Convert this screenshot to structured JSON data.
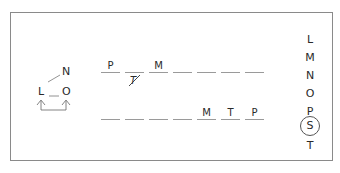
{
  "diagram": {
    "left_figure": {
      "nodes": [
        "N",
        "L",
        "O"
      ],
      "connector": "arrows from L and O joined by a bracket below"
    },
    "top_row": {
      "blanks": [
        "P",
        "",
        "M",
        "",
        "",
        "",
        ""
      ],
      "crossed_out": {
        "position": 1,
        "letter": "T"
      }
    },
    "bottom_row": {
      "blanks": [
        "",
        "",
        "",
        "",
        "M",
        "T",
        "P"
      ]
    },
    "right_column": {
      "letters": [
        "L",
        "M",
        "N",
        "O",
        "P",
        "S",
        "T"
      ],
      "circled": "S"
    }
  }
}
